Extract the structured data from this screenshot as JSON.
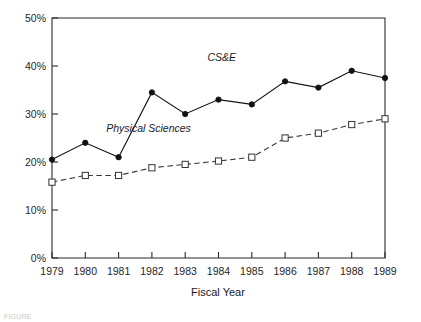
{
  "chart_data": {
    "type": "line",
    "title": "",
    "xlabel": "Fiscal Year",
    "ylabel": "",
    "categories": [
      "1979",
      "1980",
      "1981",
      "1982",
      "1983",
      "1984",
      "1985",
      "1986",
      "1987",
      "1988",
      "1989"
    ],
    "x": [
      1979,
      1980,
      1981,
      1982,
      1983,
      1984,
      1985,
      1986,
      1987,
      1988,
      1989
    ],
    "xlim": [
      1979,
      1989
    ],
    "ylim": [
      0,
      50
    ],
    "y_tick_labels": [
      "0%",
      "10%",
      "20%",
      "30%",
      "40%",
      "50%"
    ],
    "y_ticks": [
      0,
      10,
      20,
      30,
      40,
      50
    ],
    "grid": false,
    "legend_position": "inline-annotation",
    "series": [
      {
        "name": "CS&E",
        "values": [
          20.5,
          24.0,
          21.0,
          34.5,
          30.0,
          33.0,
          32.0,
          36.8,
          35.5,
          39.0,
          37.5
        ],
        "line_style": "solid",
        "marker": "filled-circle",
        "color": "#111111",
        "label_x": 1984.1,
        "label_y": 41.0
      },
      {
        "name": "Physical Sciences",
        "values": [
          15.8,
          17.2,
          17.2,
          18.8,
          19.5,
          20.2,
          21.0,
          25.0,
          26.0,
          27.8,
          29.0
        ],
        "line_style": "dashed",
        "marker": "open-square",
        "color": "#3a3a3a",
        "label_x": 1981.9,
        "label_y": 26.2
      }
    ]
  },
  "axes": {
    "x_title": "Fiscal Year",
    "y_tick_labels": [
      "50%",
      "40%",
      "30%",
      "20%",
      "10%",
      "0%"
    ],
    "x_tick_labels": [
      "1979",
      "1980",
      "1981",
      "1982",
      "1983",
      "1984",
      "1985",
      "1986",
      "1987",
      "1988",
      "1989"
    ]
  },
  "annotations": {
    "cse_label": "CS&E",
    "physical_sciences_label": "Physical Sciences"
  },
  "caption": {
    "partial_text": "FIGURE"
  }
}
